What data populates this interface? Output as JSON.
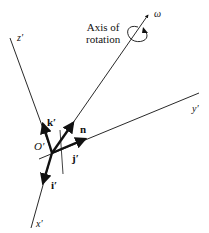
{
  "diagram": {
    "caption": {
      "line1": "Axis of",
      "line2": "rotation"
    },
    "labels": {
      "omega": "ω",
      "z_axis": "z′",
      "y_axis": "y′",
      "x_axis": "x′",
      "origin": "O′",
      "k_vec": "k′",
      "n_vec": "n",
      "j_vec": "j′",
      "i_vec": "i′"
    },
    "colors": {
      "stroke": "#111111",
      "background": "#ffffff"
    }
  }
}
